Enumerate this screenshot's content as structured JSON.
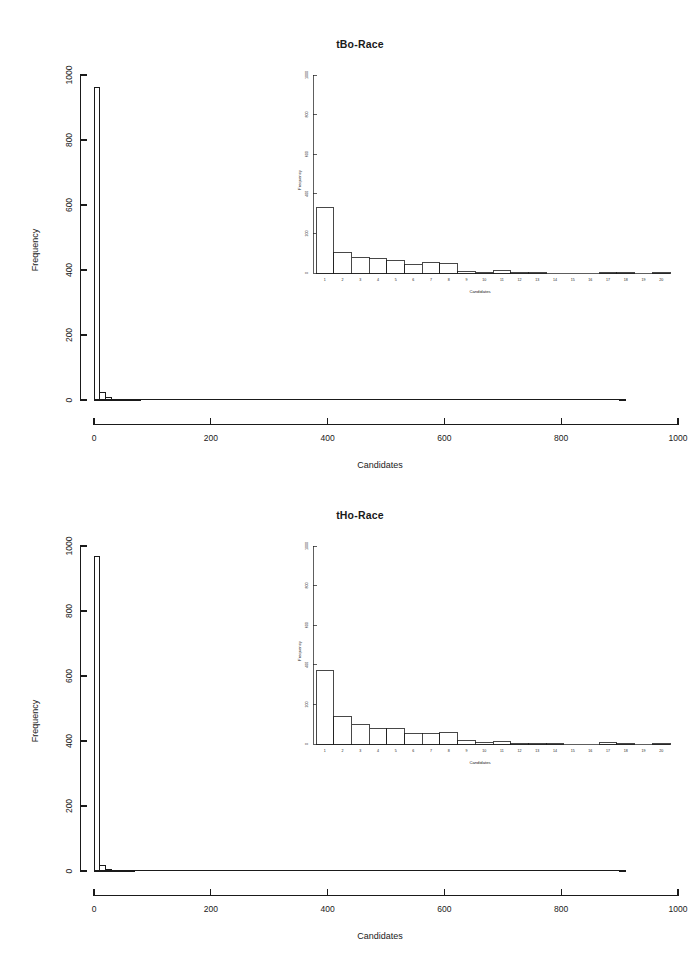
{
  "figure": {
    "background_color": "#ffffff",
    "foreground_color": "#1a1a1a",
    "panel_count": 2
  },
  "chart_data": [
    {
      "type": "bar",
      "panel": "top",
      "title": "tBo-Race",
      "xlabel": "Candidates",
      "ylabel": "Frequency",
      "xlim": [
        0,
        1000
      ],
      "ylim": [
        0,
        1000
      ],
      "xticks": [
        "0",
        "200",
        "400",
        "600",
        "800",
        "1000"
      ],
      "yticks": [
        "0",
        "200",
        "400",
        "600",
        "800",
        "1000"
      ],
      "xtick_values": [
        0,
        200,
        400,
        600,
        800,
        1000
      ],
      "ytick_values": [
        0,
        200,
        400,
        600,
        800,
        1000
      ],
      "grid": false,
      "legend": "none",
      "bin_width": 10,
      "bin_starts": [
        0,
        10,
        20,
        30,
        40,
        50,
        60,
        70,
        80,
        90,
        100,
        110,
        120,
        130,
        140,
        150,
        160,
        170,
        180,
        190,
        200,
        300,
        400,
        500,
        600,
        700,
        800,
        900
      ],
      "values": [
        962,
        22,
        8,
        3,
        2,
        1,
        1,
        1,
        0,
        0,
        0,
        0,
        0,
        0,
        0,
        0,
        0,
        0,
        0,
        0,
        0,
        0,
        0,
        0,
        0,
        0,
        0,
        1
      ],
      "inset": {
        "type": "bar",
        "title": "",
        "xlabel": "Candidates",
        "ylabel": "Frequency",
        "xlim": [
          0,
          20
        ],
        "ylim": [
          0,
          1000
        ],
        "yticks": [
          "0",
          "200",
          "400",
          "600",
          "800",
          "1000"
        ],
        "ytick_values": [
          0,
          200,
          400,
          600,
          800,
          1000
        ],
        "categories": [
          "1",
          "2",
          "3",
          "4",
          "5",
          "6",
          "7",
          "8",
          "9",
          "10",
          "11",
          "12",
          "13",
          "14",
          "15",
          "16",
          "17",
          "18",
          "19",
          "20"
        ],
        "values": [
          333,
          106,
          80,
          71,
          63,
          44,
          51,
          48,
          10,
          5,
          11,
          3,
          1,
          0,
          0,
          0,
          5,
          1,
          0,
          1
        ],
        "grid": false,
        "legend": "none"
      }
    },
    {
      "type": "bar",
      "panel": "bottom",
      "title": "tHo-Race",
      "xlabel": "Candidates",
      "ylabel": "Frequency",
      "xlim": [
        0,
        1000
      ],
      "ylim": [
        0,
        1000
      ],
      "xticks": [
        "0",
        "200",
        "400",
        "600",
        "800",
        "1000"
      ],
      "yticks": [
        "0",
        "200",
        "400",
        "600",
        "800",
        "1000"
      ],
      "xtick_values": [
        0,
        200,
        400,
        600,
        800,
        1000
      ],
      "ytick_values": [
        0,
        200,
        400,
        600,
        800,
        1000
      ],
      "grid": false,
      "legend": "none",
      "bin_width": 10,
      "bin_starts": [
        0,
        10,
        20,
        30,
        40,
        50,
        60,
        70,
        80,
        90,
        100,
        110,
        120,
        130,
        140,
        150,
        160,
        170,
        180,
        190,
        200,
        300,
        400,
        500,
        600,
        700,
        800,
        900
      ],
      "values": [
        968,
        18,
        6,
        3,
        2,
        1,
        1,
        0,
        0,
        0,
        0,
        0,
        0,
        0,
        0,
        0,
        0,
        0,
        0,
        0,
        0,
        0,
        0,
        0,
        0,
        0,
        0,
        1
      ],
      "inset": {
        "type": "bar",
        "title": "",
        "xlabel": "Candidates",
        "ylabel": "Frequency",
        "xlim": [
          0,
          20
        ],
        "ylim": [
          0,
          1000
        ],
        "yticks": [
          "0",
          "200",
          "400",
          "600",
          "800",
          "1000"
        ],
        "ytick_values": [
          0,
          200,
          400,
          600,
          800,
          1000
        ],
        "categories": [
          "1",
          "2",
          "3",
          "4",
          "5",
          "6",
          "7",
          "8",
          "9",
          "10",
          "11",
          "12",
          "13",
          "14",
          "15",
          "16",
          "17",
          "18",
          "19",
          "20"
        ],
        "values": [
          372,
          139,
          101,
          80,
          80,
          55,
          52,
          58,
          18,
          6,
          11,
          4,
          1,
          1,
          0,
          0,
          7,
          1,
          0,
          1
        ],
        "grid": false,
        "legend": "none"
      }
    }
  ]
}
